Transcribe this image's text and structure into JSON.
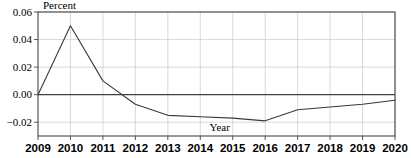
{
  "chart_data": {
    "type": "line",
    "title": "",
    "xlabel": "Year",
    "ylabel": "Percent",
    "x": [
      2009,
      2010,
      2011,
      2012,
      2013,
      2014,
      2015,
      2016,
      2017,
      2018,
      2019,
      2020
    ],
    "categories": [
      "2009",
      "2010",
      "2011",
      "2012",
      "2013",
      "2014",
      "2015",
      "2016",
      "2017",
      "2018",
      "2019",
      "2020"
    ],
    "values": [
      0.0,
      0.05,
      0.01,
      -0.007,
      -0.015,
      -0.016,
      -0.017,
      -0.019,
      -0.011,
      -0.009,
      -0.007,
      -0.004
    ],
    "series": [
      {
        "name": "Percent",
        "values": [
          0.0,
          0.05,
          0.01,
          -0.007,
          -0.015,
          -0.016,
          -0.017,
          -0.019,
          -0.011,
          -0.009,
          -0.007,
          -0.004
        ]
      }
    ],
    "ylim": [
      -0.03,
      0.06
    ],
    "xlim": [
      2009,
      2020
    ],
    "yticks": [
      0.06,
      0.04,
      0.02,
      0.0,
      -0.02
    ],
    "ytick_labels": [
      "0.06",
      "0.04",
      "0.02",
      "0.00",
      "−0.02"
    ],
    "xticks": [
      2009,
      2010,
      2011,
      2012,
      2013,
      2014,
      2015,
      2016,
      2017,
      2018,
      2019,
      2020
    ],
    "xtick_labels": [
      "2009",
      "2010",
      "2011",
      "2012",
      "2013",
      "2014",
      "2015",
      "2016",
      "2017",
      "2018",
      "2019",
      "2020"
    ],
    "grid": true,
    "grid_color": "#c8c8c8",
    "legend": "none",
    "line_color": "#3a3a3a",
    "zero_line": true,
    "zero_line_color": "#404040",
    "border_color": "#555555",
    "background": "#ffffff"
  },
  "axis": {
    "y_title": "Percent",
    "x_title": "Year",
    "y_labels": {
      "t0": "0.06",
      "t1": "0.04",
      "t2": "0.02",
      "t3": "0.00",
      "t4": "−0.02"
    },
    "x_labels": {
      "t0": "2009",
      "t1": "2010",
      "t2": "2011",
      "t3": "2012",
      "t4": "2013",
      "t5": "2014",
      "t6": "2015",
      "t7": "2016",
      "t8": "2017",
      "t9": "2018",
      "t10": "2019",
      "t11": "2020"
    }
  }
}
